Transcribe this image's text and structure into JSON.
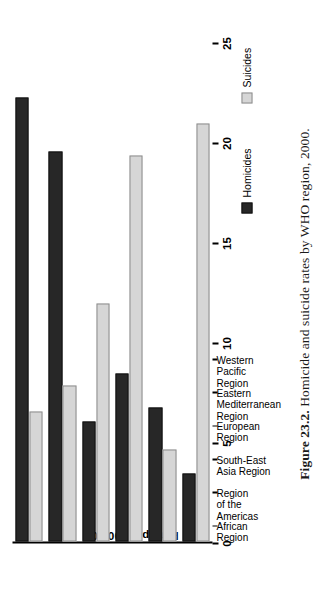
{
  "figure": {
    "number": "Figure 23.2.",
    "caption": "Homicide and suicide rates by WHO region, 2000."
  },
  "chart_data": {
    "type": "bar",
    "orientation": "vertical",
    "title": "",
    "subtitle": "",
    "xlabel": "",
    "ylabel": "Rate per 100,000",
    "ylim": [
      0,
      25
    ],
    "ytick_step": 5,
    "yticks": [
      "0",
      "5",
      "10",
      "15",
      "20",
      "25"
    ],
    "grid": false,
    "legend_position": "top-left",
    "categories": [
      "African Region",
      "Region of the Americas",
      "South-East Asia Region",
      "European Region",
      "Eastern Mediterranean Region",
      "Western Pacific Region"
    ],
    "category_labels_multiline": [
      "African\nRegion",
      "Region\nof the\nAmericas",
      "South-East\nAsia Region",
      "European\nRegion",
      "Eastern\nMediterranean\nRegion",
      "Western\nPacific\nRegion"
    ],
    "series": [
      {
        "name": "Homicides",
        "color": "#272727",
        "values": [
          22.2,
          19.5,
          6.0,
          8.4,
          6.7,
          3.4
        ]
      },
      {
        "name": "Suicides",
        "color": "#d6d6d6",
        "values": [
          6.5,
          7.8,
          11.9,
          19.3,
          4.6,
          20.9
        ]
      }
    ]
  },
  "legend": {
    "entries": [
      {
        "label": "Homicides",
        "swatch": "homicides"
      },
      {
        "label": "Suicides",
        "swatch": "suicides"
      }
    ]
  },
  "colors": {
    "homicides": "#272727",
    "suicides": "#d6d6d6",
    "axis": "#000000",
    "background": "#ffffff"
  }
}
